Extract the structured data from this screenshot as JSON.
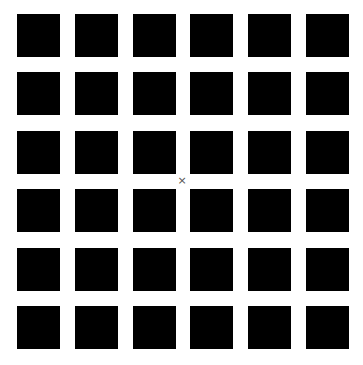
{
  "grid": {
    "rows": 6,
    "cols": 6,
    "origin_x": 17,
    "origin_y": 14,
    "pitch_x": 57.8,
    "pitch_y": 58.4,
    "square_size": 43,
    "square_color": "#000000",
    "background_color": "#ffffff"
  },
  "fixation": {
    "symbol": "×",
    "x": 182,
    "y": 181
  }
}
